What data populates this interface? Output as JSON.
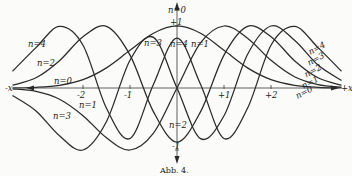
{
  "chart_data": {
    "type": "line",
    "title": "",
    "caption": "Abb. 4.",
    "xlabel_pos": "+x",
    "xlabel_neg": "-x",
    "xlim": [
      -3.7,
      3.7
    ],
    "ylim": [
      -1.3,
      1.35
    ],
    "grid": false,
    "legend": "inline curve labels",
    "x_ticks": [
      {
        "value": -2,
        "label": "-2"
      },
      {
        "value": -1,
        "label": "-1"
      },
      {
        "value": 1,
        "label": "+1"
      },
      {
        "value": 2,
        "label": "+2"
      }
    ],
    "y_ticks": [
      {
        "value": 1,
        "label": "+1"
      },
      {
        "value": -1,
        "label": "-1"
      }
    ],
    "x": [
      -3.5,
      -3,
      -2.5,
      -2,
      -1.5,
      -1,
      -0.5,
      0,
      0.5,
      1,
      1.5,
      2,
      2.5,
      3,
      3.5
    ],
    "series": [
      {
        "name": "n=0",
        "values": [
          0.002,
          0.011,
          0.044,
          0.135,
          0.325,
          0.607,
          0.883,
          1.0,
          0.883,
          0.607,
          0.325,
          0.135,
          0.044,
          0.011,
          0.002
        ]
      },
      {
        "name": "n=1",
        "values": [
          -0.013,
          -0.055,
          -0.181,
          -0.446,
          -0.803,
          -1.0,
          -0.728,
          0.0,
          0.728,
          1.0,
          0.803,
          0.446,
          0.181,
          0.055,
          0.013
        ]
      },
      {
        "name": "n=2",
        "values": [
          0.045,
          0.165,
          0.441,
          0.827,
          0.993,
          0.53,
          -0.385,
          -0.873,
          -0.385,
          0.53,
          0.993,
          0.827,
          0.441,
          0.165,
          0.045
        ]
      },
      {
        "name": "n=3",
        "values": [
          -0.122,
          -0.37,
          -0.771,
          -1.0,
          -0.54,
          0.448,
          0.816,
          0.0,
          -0.816,
          -0.448,
          0.54,
          1.0,
          0.771,
          0.37,
          0.122
        ]
      },
      {
        "name": "n=4",
        "values": [
          0.27,
          0.652,
          0.993,
          0.69,
          -0.327,
          -0.814,
          0.059,
          0.805,
          0.059,
          -0.814,
          -0.327,
          0.69,
          0.993,
          0.652,
          0.27
        ]
      }
    ],
    "annotations": [
      {
        "text": "n=0",
        "near": "top of y-axis, peak of n=0"
      },
      {
        "text": "+1",
        "near": "y-axis tick +1"
      },
      {
        "text": "n=4",
        "near": "center peak of n=4"
      },
      {
        "text": "n=3",
        "near": "left-center lobe of n=3"
      },
      {
        "text": "n=1",
        "near": "right-center lobe of n=1"
      },
      {
        "text": "n=2",
        "near": "bottom center, minimum of n=2"
      },
      {
        "text": "n=4",
        "near": "far left, upper"
      },
      {
        "text": "n=2",
        "near": "far left"
      },
      {
        "text": "n=0",
        "near": "far left, near axis"
      },
      {
        "text": "n=1",
        "near": "far left, below axis"
      },
      {
        "text": "n=3",
        "near": "far left, lower"
      },
      {
        "text": "n=4",
        "near": "far right, upper"
      },
      {
        "text": "n=3",
        "near": "far right"
      },
      {
        "text": "n=2",
        "near": "far right"
      },
      {
        "text": "n=1",
        "near": "far right"
      },
      {
        "text": "n=0",
        "near": "far right, near axis"
      }
    ]
  },
  "labels": {
    "center_n0": "n=0",
    "center_plus1": "+1",
    "center_n3": "n=3",
    "center_n4": "n=4",
    "center_n1": "n=1",
    "center_n2": "n=2",
    "minus1": "-1",
    "left_n4": "n=4",
    "left_n2": "n=2",
    "left_n0": "n=0",
    "left_n1": "n=1",
    "left_n3": "n=3",
    "right_n4": "n=4",
    "right_n3": "n=3",
    "right_n2": "n=2",
    "right_n1": "n=1",
    "right_n0": "n=0",
    "x_pos": "+x",
    "x_neg": "-x",
    "caption": "Abb. 4."
  }
}
